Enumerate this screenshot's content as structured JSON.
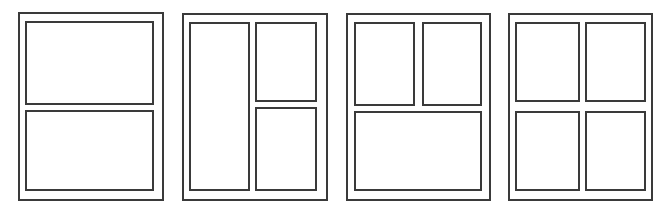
{
  "diagram": {
    "type": "page-layout-templates",
    "stroke_color": "#3a3a3a",
    "background": "#ffffff",
    "layouts": [
      {
        "name": "two-horizontal-panels",
        "page": {
          "x": 18,
          "y": 12,
          "w": 146,
          "h": 189
        },
        "panels": [
          {
            "x": 25,
            "y": 21,
            "w": 129,
            "h": 84
          },
          {
            "x": 25,
            "y": 110,
            "w": 129,
            "h": 81
          }
        ]
      },
      {
        "name": "tall-left-two-right",
        "page": {
          "x": 182,
          "y": 13,
          "w": 146,
          "h": 188
        },
        "panels": [
          {
            "x": 189,
            "y": 22,
            "w": 61,
            "h": 169
          },
          {
            "x": 255,
            "y": 22,
            "w": 62,
            "h": 80
          },
          {
            "x": 255,
            "y": 107,
            "w": 62,
            "h": 84
          }
        ]
      },
      {
        "name": "two-top-one-bottom",
        "page": {
          "x": 346,
          "y": 13,
          "w": 145,
          "h": 188
        },
        "panels": [
          {
            "x": 354,
            "y": 22,
            "w": 61,
            "h": 84
          },
          {
            "x": 422,
            "y": 22,
            "w": 60,
            "h": 84
          },
          {
            "x": 354,
            "y": 111,
            "w": 128,
            "h": 80
          }
        ]
      },
      {
        "name": "four-grid",
        "page": {
          "x": 508,
          "y": 13,
          "w": 145,
          "h": 188
        },
        "panels": [
          {
            "x": 515,
            "y": 22,
            "w": 65,
            "h": 80
          },
          {
            "x": 585,
            "y": 22,
            "w": 61,
            "h": 80
          },
          {
            "x": 515,
            "y": 111,
            "w": 65,
            "h": 80
          },
          {
            "x": 585,
            "y": 111,
            "w": 61,
            "h": 80
          }
        ]
      }
    ]
  }
}
